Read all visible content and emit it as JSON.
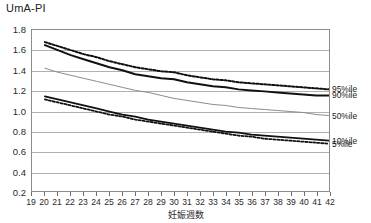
{
  "chart_data": {
    "type": "line",
    "title": "UmA-PI",
    "xlabel": "妊娠週数",
    "ylabel": "",
    "xlim": [
      19,
      42
    ],
    "ylim": [
      0.2,
      1.8
    ],
    "grid": true,
    "legend_position": "right",
    "x_ticks": [
      19,
      20,
      21,
      22,
      23,
      24,
      25,
      26,
      27,
      28,
      29,
      30,
      31,
      32,
      33,
      34,
      35,
      36,
      37,
      38,
      39,
      40,
      41,
      42
    ],
    "y_ticks": [
      "0.2",
      "0.4",
      "0.6",
      "0.8",
      "1.0",
      "1.2",
      "1.4",
      "1.6",
      "1.8"
    ],
    "x": [
      20,
      21,
      22,
      23,
      24,
      25,
      26,
      27,
      28,
      29,
      30,
      31,
      32,
      33,
      34,
      35,
      36,
      37,
      38,
      39,
      40,
      41,
      42
    ],
    "series": [
      {
        "name": "95%ile",
        "style": "dotted",
        "color": "#111111",
        "width": 2.0,
        "values": [
          1.68,
          1.64,
          1.6,
          1.56,
          1.53,
          1.49,
          1.46,
          1.43,
          1.41,
          1.39,
          1.38,
          1.35,
          1.33,
          1.31,
          1.3,
          1.28,
          1.27,
          1.26,
          1.25,
          1.24,
          1.23,
          1.22,
          1.21
        ]
      },
      {
        "name": "90%ile",
        "style": "solid",
        "color": "#111111",
        "width": 2.0,
        "values": [
          1.65,
          1.6,
          1.55,
          1.51,
          1.47,
          1.43,
          1.4,
          1.36,
          1.34,
          1.32,
          1.31,
          1.28,
          1.26,
          1.24,
          1.23,
          1.21,
          1.2,
          1.19,
          1.18,
          1.17,
          1.16,
          1.15,
          1.15
        ]
      },
      {
        "name": "50%ile",
        "style": "solid",
        "color": "#8c8c8c",
        "width": 1.0,
        "values": [
          1.42,
          1.38,
          1.35,
          1.32,
          1.29,
          1.26,
          1.23,
          1.2,
          1.18,
          1.15,
          1.12,
          1.1,
          1.08,
          1.06,
          1.05,
          1.03,
          1.02,
          1.01,
          1.0,
          0.99,
          0.98,
          0.96,
          0.95
        ]
      },
      {
        "name": "10%ile",
        "style": "solid",
        "color": "#111111",
        "width": 1.8,
        "values": [
          1.14,
          1.11,
          1.08,
          1.05,
          1.02,
          0.99,
          0.96,
          0.94,
          0.91,
          0.89,
          0.87,
          0.85,
          0.83,
          0.81,
          0.79,
          0.78,
          0.76,
          0.75,
          0.74,
          0.73,
          0.72,
          0.71,
          0.7
        ]
      },
      {
        "name": "5%ile",
        "style": "dotted",
        "color": "#111111",
        "width": 1.8,
        "values": [
          1.11,
          1.08,
          1.05,
          1.02,
          0.99,
          0.96,
          0.94,
          0.91,
          0.89,
          0.87,
          0.85,
          0.83,
          0.81,
          0.79,
          0.77,
          0.75,
          0.74,
          0.72,
          0.71,
          0.7,
          0.69,
          0.68,
          0.67
        ]
      }
    ],
    "legend_entries": [
      {
        "label": "95%ile",
        "value_at_end": 1.21
      },
      {
        "label": "90%ile",
        "value_at_end": 1.15
      },
      {
        "label": "50%ile",
        "value_at_end": 0.95
      },
      {
        "label": "10%ile",
        "value_at_end": 0.7
      },
      {
        "label": "5%ile",
        "value_at_end": 0.67
      }
    ]
  }
}
